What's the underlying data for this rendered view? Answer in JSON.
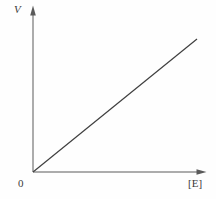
{
  "figure": {
    "background_color": "#fefefe"
  },
  "chart_data": {
    "type": "line",
    "title": "",
    "xlabel": "[E]",
    "ylabel": "V",
    "origin_label": "0",
    "xlim": [
      0,
      1
    ],
    "ylim": [
      0,
      1
    ],
    "grid": false,
    "legend": "none",
    "series": [
      {
        "name": "V vs [E]",
        "x": [
          0,
          1
        ],
        "y": [
          0,
          1
        ]
      }
    ],
    "annotations": "Straight line through the origin: V rises proportionally with [E]",
    "line_color": "#3f3f3f",
    "axis_color": "#5a5a5a",
    "label_color": "#3a3a3a"
  }
}
